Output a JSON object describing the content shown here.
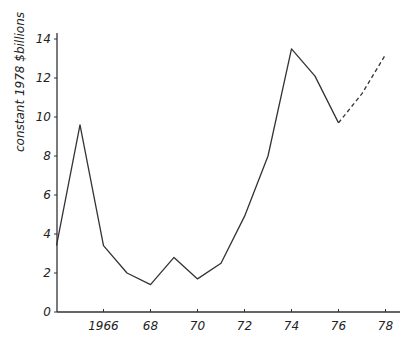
{
  "chart_data": {
    "type": "line",
    "title": "",
    "xlabel": "",
    "ylabel": "constant 1978 $billions",
    "ylim": [
      0,
      14
    ],
    "xlim": [
      1964,
      1979
    ],
    "yticks": [
      0,
      2,
      4,
      6,
      8,
      10,
      12,
      14
    ],
    "ytick_labels": [
      "0",
      "2",
      "4",
      "6",
      "8",
      "10",
      "12",
      "14"
    ],
    "xticks": [
      1966,
      1968,
      1970,
      1972,
      1974,
      1976,
      1978
    ],
    "xtick_labels": [
      "1966",
      "68",
      "70",
      "72",
      "74",
      "76",
      "78"
    ],
    "grid": false,
    "legend": null,
    "series": [
      {
        "name": "actual",
        "style": "solid",
        "x": [
          1964,
          1965,
          1966,
          1967,
          1968,
          1969,
          1970,
          1971,
          1972,
          1973,
          1974,
          1975,
          1976
        ],
        "values": [
          3.4,
          9.6,
          3.4,
          2.0,
          1.4,
          2.8,
          1.7,
          2.5,
          4.9,
          8.0,
          13.5,
          12.1,
          9.7
        ]
      },
      {
        "name": "projected",
        "style": "dashed",
        "x": [
          1976,
          1977,
          1978
        ],
        "values": [
          9.7,
          11.2,
          13.2
        ]
      }
    ]
  }
}
